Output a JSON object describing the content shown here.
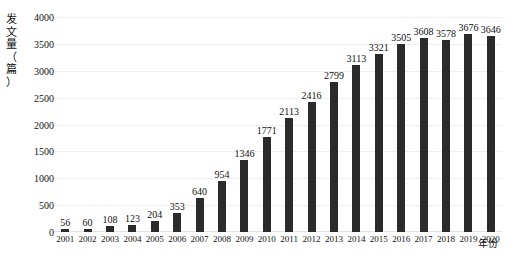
{
  "chart_data": {
    "type": "bar",
    "title": "",
    "subtitle": "",
    "xlabel": "年份",
    "ylabel": "发文量（篇）",
    "ylabel_chars": "发\n文\n量\n（\n篇\n）",
    "categories": [
      "2001",
      "2002",
      "2003",
      "2004",
      "2005",
      "2006",
      "2007",
      "2008",
      "2009",
      "2010",
      "2011",
      "2012",
      "2013",
      "2014",
      "2015",
      "2016",
      "2017",
      "2018",
      "2019",
      "2020"
    ],
    "values": [
      56,
      60,
      108,
      123,
      204,
      353,
      640,
      954,
      1346,
      1771,
      2113,
      2416,
      2799,
      3113,
      3321,
      3505,
      3608,
      3578,
      3676,
      3646
    ],
    "value_labels": [
      "56",
      "60",
      "108",
      "123",
      "204",
      "353",
      "640",
      "954",
      "1346",
      "1771",
      "2113",
      "2416",
      "2799",
      "3113",
      "3321",
      "3505",
      "3608",
      "3578",
      "3676",
      "3646"
    ],
    "ylim": [
      0,
      4000
    ],
    "ytick_values": [
      0,
      500,
      1000,
      1500,
      2000,
      2500,
      3000,
      3500,
      4000
    ],
    "ytick_labels": [
      "0",
      "500",
      "1000",
      "1500",
      "2000",
      "2500",
      "3000",
      "3500",
      "4000"
    ],
    "grid": true,
    "grid_axis": "y",
    "legend": false,
    "legend_position": "none",
    "series": [
      {
        "name": "发文量",
        "values": [
          56,
          60,
          108,
          123,
          204,
          353,
          640,
          954,
          1346,
          1771,
          2113,
          2416,
          2799,
          3113,
          3321,
          3505,
          3608,
          3578,
          3676,
          3646
        ]
      }
    ],
    "colors": {
      "bar": "#2b2b2b",
      "grid": "#efefef",
      "background": "#ffffff",
      "text": "#111111"
    }
  }
}
